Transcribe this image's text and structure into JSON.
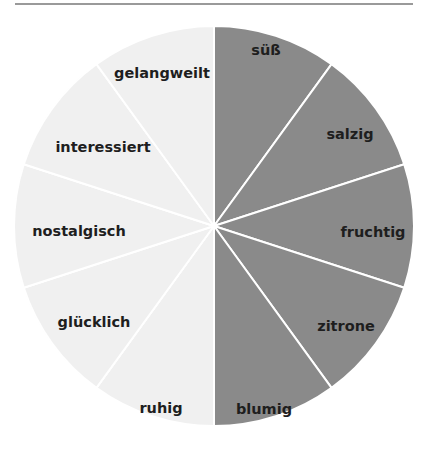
{
  "chart_data": {
    "type": "pie",
    "title": "",
    "center": [
      214,
      226
    ],
    "radius": 200,
    "start_angle_deg": 0,
    "direction": "clockwise",
    "separator_color": "#ffffff",
    "slices": [
      {
        "label": "süß",
        "value": 10,
        "color": "#8a8a8a",
        "label_pos": [
          266,
          51
        ]
      },
      {
        "label": "salzig",
        "value": 10,
        "color": "#8a8a8a",
        "label_pos": [
          350,
          135
        ]
      },
      {
        "label": "fruchtig",
        "value": 10,
        "color": "#8a8a8a",
        "label_pos": [
          373,
          233
        ]
      },
      {
        "label": "zitrone",
        "value": 10,
        "color": "#8a8a8a",
        "label_pos": [
          346,
          327
        ]
      },
      {
        "label": "blumig",
        "value": 10,
        "color": "#8a8a8a",
        "label_pos": [
          264,
          410
        ]
      },
      {
        "label": "ruhig",
        "value": 10,
        "color": "#f0f0f0",
        "label_pos": [
          161,
          409
        ]
      },
      {
        "label": "glücklich",
        "value": 10,
        "color": "#f0f0f0",
        "label_pos": [
          94,
          323
        ]
      },
      {
        "label": "nostalgisch",
        "value": 10,
        "color": "#f0f0f0",
        "label_pos": [
          79,
          232
        ]
      },
      {
        "label": "interessiert",
        "value": 10,
        "color": "#f0f0f0",
        "label_pos": [
          103,
          148
        ]
      },
      {
        "label": "gelangweilt",
        "value": 10,
        "color": "#f0f0f0",
        "label_pos": [
          162,
          74
        ]
      }
    ],
    "legend": null
  },
  "colors": {
    "dark_half": "#8a8a8a",
    "light_half": "#f0f0f0",
    "separator": "#ffffff",
    "label_text": "#1e1e1e",
    "top_rule": "#9a9a9a"
  }
}
